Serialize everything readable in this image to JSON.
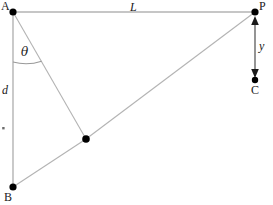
{
  "figure": {
    "width": 273,
    "height": 205,
    "background": "#ffffff",
    "line_color": "#b3b3b3",
    "dot_color": "#000000",
    "text_color": "#1a1a1a"
  },
  "points": {
    "A": {
      "label": "A",
      "x": 13,
      "y": 12,
      "label_x": 1,
      "label_y": 0
    },
    "P": {
      "label": "P",
      "x": 255,
      "y": 12,
      "label_x": 259,
      "label_y": 0
    },
    "B": {
      "label": "B",
      "x": 13,
      "y": 187,
      "label_x": 4,
      "label_y": 191
    },
    "C": {
      "label": "C",
      "x": 255,
      "y": 80,
      "label_x": 251,
      "label_y": 84
    },
    "M": {
      "label": "",
      "x": 86,
      "y": 139
    }
  },
  "labels": {
    "length_L": "L",
    "distance_d": "d",
    "height_y": "y",
    "angle_theta": "θ"
  },
  "label_positions": {
    "length_L": {
      "x": 130,
      "y": 1
    },
    "distance_d": {
      "x": 2,
      "y": 84
    },
    "height_y": {
      "x": 259,
      "y": 40
    },
    "angle_theta": {
      "x": 21,
      "y": 46
    }
  },
  "segments": [
    {
      "name": "A-P",
      "x1": 13,
      "y1": 12,
      "x2": 255,
      "y2": 12
    },
    {
      "name": "A-B",
      "x1": 13,
      "y1": 12,
      "x2": 13,
      "y2": 187
    },
    {
      "name": "A-M",
      "x1": 13,
      "y1": 12,
      "x2": 86,
      "y2": 139
    },
    {
      "name": "B-M",
      "x1": 13,
      "y1": 187,
      "x2": 86,
      "y2": 139
    },
    {
      "name": "M-P",
      "x1": 86,
      "y1": 139,
      "x2": 255,
      "y2": 12
    }
  ],
  "angle_arc": {
    "center_x": 13,
    "center_y": 12,
    "radius": 50,
    "start_x": 13,
    "start_y": 62,
    "end_x": 41,
    "end_y": 61
  },
  "dimension_arrow": {
    "name": "y-dimension",
    "x": 255,
    "y_top": 18,
    "y_bottom": 76,
    "double_headed": true
  },
  "tick_mark": {
    "x": 3,
    "y": 128
  }
}
